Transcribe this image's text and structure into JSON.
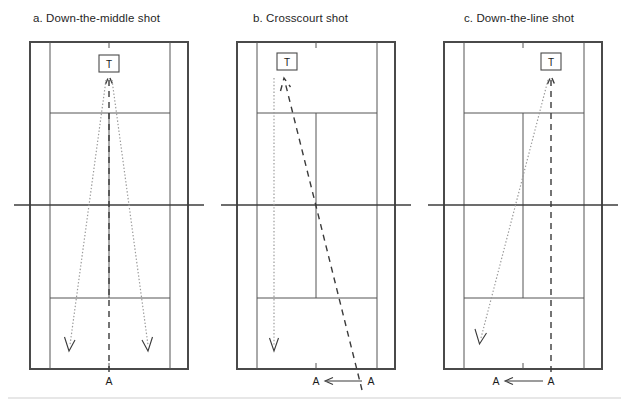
{
  "figure": {
    "background_color": "#ffffff",
    "width": 629,
    "height": 405,
    "line_color": "#555555",
    "outer_line_color": "#4a4a4a",
    "dashed_color": "#3a3a3a",
    "dotted_color": "#9a9a9a"
  },
  "panels": [
    {
      "id": "a",
      "title": "a. Down-the-middle shot",
      "player_marker": "T",
      "opponent_marker": "A",
      "bottom_labels": [
        "A"
      ],
      "court": {
        "outer_left": 30,
        "outer_right": 188,
        "singles_left": 50,
        "singles_right": 170,
        "top": 42,
        "bottom": 369,
        "net_y": 205,
        "service_top_y": 113,
        "service_bottom_y": 298,
        "center_x": 109
      },
      "shot_description": "Player A hits from the baseline center; two dotted return trajectories fan out to the deep left and deep right corners, while the dashed line runs straight up the middle to T."
    },
    {
      "id": "b",
      "title": "b. Crosscourt shot",
      "player_marker": "T",
      "opponent_marker": "A",
      "bottom_labels": [
        "A",
        "A"
      ],
      "court": {
        "outer_left": 237,
        "outer_right": 395,
        "singles_left": 257,
        "singles_right": 377,
        "top": 42,
        "bottom": 369,
        "net_y": 205,
        "service_top_y": 113,
        "service_bottom_y": 298,
        "center_x": 316
      },
      "shot_description": "Player A moves across the baseline to the right corner and strikes a crosscourt dashed shot diagonally up to T; a dotted recovery line drops straight down the left side."
    },
    {
      "id": "c",
      "title": "c. Down-the-line shot",
      "player_marker": "T",
      "opponent_marker": "A",
      "bottom_labels": [
        "A",
        "A"
      ],
      "court": {
        "outer_left": 444,
        "outer_right": 602,
        "singles_left": 464,
        "singles_right": 584,
        "top": 42,
        "bottom": 369,
        "net_y": 205,
        "service_top_y": 113,
        "service_bottom_y": 298,
        "center_x": 523
      },
      "shot_description": "Player A moves left along the baseline; the dashed line runs straight up the line to T while the dotted trajectory angles down to the far deep left corner."
    }
  ],
  "footer": {
    "rule_visible": true
  }
}
